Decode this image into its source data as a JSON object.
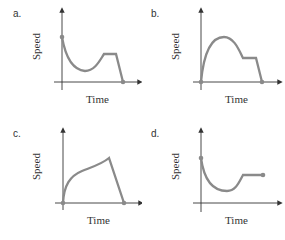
{
  "graphs": [
    {
      "letter": "a.",
      "ylabel": "Speed",
      "xlabel": "Time",
      "description": "Starts at positive speed, decreases to a minimum, increases, holds constant, then drops to zero"
    },
    {
      "letter": "b.",
      "ylabel": "Speed",
      "xlabel": "Time",
      "description": "Starts at zero, rises to a peak, decreases, holds constant, then drops to zero"
    },
    {
      "letter": "c.",
      "ylabel": "Speed",
      "xlabel": "Time",
      "description": "Starts at zero, increases quickly then slowly, then drops linearly to zero"
    },
    {
      "letter": "d.",
      "ylabel": "Speed",
      "xlabel": "Time",
      "description": "Starts at positive speed, decreases to a minimum, increases, then holds constant"
    }
  ],
  "colors": {
    "curve": "#8a8a8a",
    "axis": "#333333",
    "dot": "#8a8a8a",
    "text": "#333333"
  }
}
